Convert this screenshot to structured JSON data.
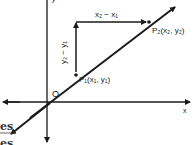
{
  "diagram": {
    "axes": {
      "x_label": "x",
      "y_label": "y",
      "origin_label": "O"
    },
    "points": [
      {
        "name": "P1",
        "label": "P₁(x₁, y₁)"
      },
      {
        "name": "P2",
        "label": "P₂(x₂, y₂)"
      }
    ],
    "horizontal_arrow_label": "x₂ − x₁",
    "vertical_arrow_label": "y₂ − y₁",
    "line_color": "#1a1a1a"
  },
  "footer_text": {
    "line1": "es",
    "line2": "es"
  }
}
